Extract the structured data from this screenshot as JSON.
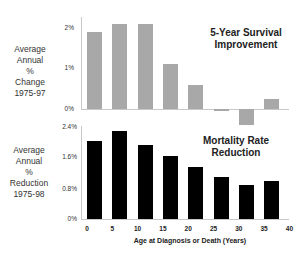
{
  "chart_data": [
    {
      "type": "bar",
      "title": "5-Year Survival Improvement",
      "ylabel": "Average Annual % Change 1975-97",
      "xlabel": "Age at Diagnosis or Death (Years)",
      "categories": [
        "0-5",
        "5-10",
        "10-15",
        "15-20",
        "20-25",
        "25-30",
        "30-35",
        "35-40"
      ],
      "values": [
        1.9,
        2.1,
        2.1,
        1.1,
        0.6,
        -0.05,
        -0.4,
        0.25
      ],
      "yticks": [
        "0%",
        "1%",
        "2%"
      ],
      "ylim": [
        -0.5,
        2.1
      ],
      "color": "#a8a8a8"
    },
    {
      "type": "bar",
      "title": "Mortality Rate Reduction",
      "ylabel": "Average Annual % Reduction 1975-98",
      "xlabel": "Age at Diagnosis or Death (Years)",
      "categories": [
        "0-5",
        "5-10",
        "10-15",
        "15-20",
        "20-25",
        "25-30",
        "30-35",
        "35-40"
      ],
      "values": [
        2.03,
        2.3,
        1.94,
        1.65,
        1.35,
        1.1,
        0.9,
        1.0
      ],
      "yticks": [
        "0%",
        "0.8%",
        "1.6%",
        "2.4%"
      ],
      "ylim": [
        0,
        2.4
      ],
      "xticks": [
        "0",
        "5",
        "10",
        "15",
        "20",
        "25",
        "30",
        "35",
        "40"
      ],
      "color": "#000000"
    }
  ],
  "top": {
    "title_line1": "5-Year Survival",
    "title_line2": "Improvement",
    "ylabel": [
      "Average",
      "Annual",
      "%",
      "Change",
      "1975-97"
    ],
    "ticks": [
      "2%",
      "1%",
      "0%"
    ]
  },
  "bottom": {
    "title_line1": "Mortality Rate",
    "title_line2": "Reduction",
    "ylabel": [
      "Average",
      "Annual",
      "%",
      "Reduction",
      "1975-98"
    ],
    "ticks": [
      "2.4%",
      "1.6%",
      "0.8%",
      "0%"
    ],
    "xticks": [
      "0",
      "5",
      "10",
      "15",
      "20",
      "25",
      "30",
      "35",
      "40"
    ],
    "xlabel": "Age at Diagnosis or Death (Years)"
  }
}
